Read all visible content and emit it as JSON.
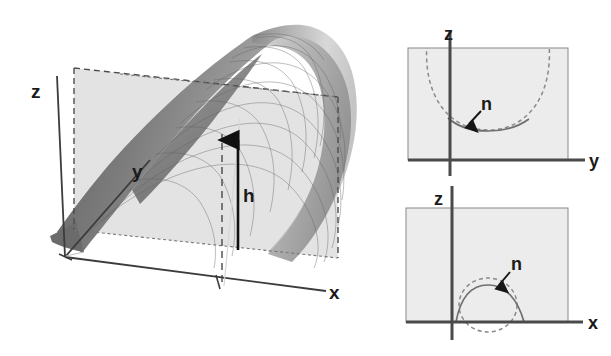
{
  "figure": {
    "background_color": "#ffffff",
    "ink_color": "#1a1a1a"
  },
  "main_panel": {
    "name": "3d-saddle-surface",
    "description": "Three-dimensional saddle (hyperbolic paraboloid) surface drawn as a shaded wireframe mesh, intersected by a translucent vertical plane.",
    "surface_type": "hyperbolic paraboloid (saddle)",
    "axes": [
      {
        "id": "z",
        "label": "z",
        "direction": "vertical-up",
        "label_x": 37,
        "label_y": 92
      },
      {
        "id": "y",
        "label": "y",
        "direction": "into-depth-upper-right",
        "label_x": 138,
        "label_y": 172
      },
      {
        "id": "x",
        "label": "x",
        "direction": "horizontal-right",
        "label_x": 334,
        "label_y": 298
      }
    ],
    "annotations": [
      {
        "id": "h",
        "label": "h",
        "kind": "vertical-double-ended-measure",
        "label_x": 248,
        "label_y": 196
      }
    ],
    "plane": {
      "name": "cross-section-plane",
      "style": "dashed outline, light gray translucent fill",
      "fill_color": "#e2e2e2",
      "edge_color": "#4d4d4d"
    },
    "surface_shading": {
      "dark_gray": "#707070",
      "mid_gray": "#9a9a9a",
      "light_gray": "#d4d4d4",
      "mesh_color": "#5f5f5f"
    }
  },
  "side_panels": [
    {
      "name": "zy-cross-section",
      "position": "top-right",
      "horizontal_axis_label": "y",
      "vertical_axis_label": "z",
      "curve_label": "n",
      "curve_shape": "concave-up arc (valley) — surface curves upward along y",
      "curve_style_dashed": "dashed continuation circle",
      "curve_style_solid": "solid profile segment",
      "fill_color": "#ececec"
    },
    {
      "name": "zx-cross-section",
      "position": "bottom-right",
      "horizontal_axis_label": "x",
      "vertical_axis_label": "z",
      "curve_label": "n",
      "curve_shape": "concave-down arc (ridge) — surface curves downward along x",
      "curve_style_dashed": "dashed continuation circle",
      "curve_style_solid": "solid profile segment",
      "fill_color": "#ececec"
    }
  ]
}
